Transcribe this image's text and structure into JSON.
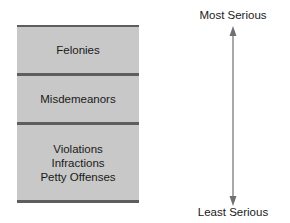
{
  "diagram": {
    "categories": [
      {
        "lines": [
          "Felonies"
        ]
      },
      {
        "lines": [
          "Misdemeanors"
        ]
      },
      {
        "lines": [
          "Violations",
          "Infractions",
          "Petty Offenses"
        ]
      }
    ],
    "scale": {
      "top_label": "Most Serious",
      "bottom_label": "Least Serious"
    },
    "colors": {
      "band_fill": "#c8c8c8",
      "divider": "#5e5e5e",
      "arrow": "#707070"
    }
  }
}
